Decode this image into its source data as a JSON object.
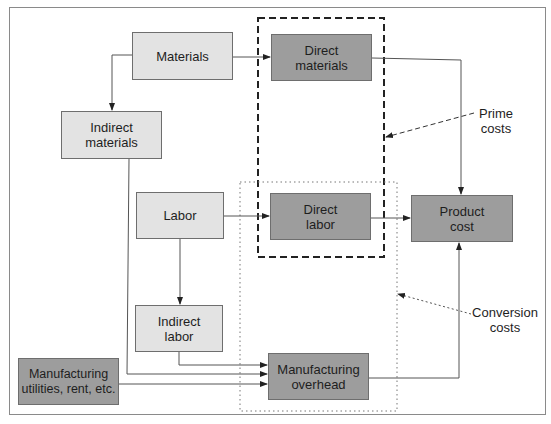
{
  "diagram": {
    "nodes": {
      "materials": {
        "label": "Materials",
        "fill": "#e3e3e3"
      },
      "indirect_materials": {
        "label": "Indirect materials",
        "fill": "#e3e3e3"
      },
      "labor": {
        "label": "Labor",
        "fill": "#e3e3e3"
      },
      "indirect_labor": {
        "label": "Indirect labor",
        "fill": "#e3e3e3"
      },
      "manufacturing_utilities": {
        "label": "Manufacturing utilities, rent, etc.",
        "fill": "#9d9d9d"
      },
      "direct_materials": {
        "label": "Direct materials",
        "fill": "#9d9d9d"
      },
      "direct_labor": {
        "label": "Direct labor",
        "fill": "#9d9d9d"
      },
      "manufacturing_overhead": {
        "label": "Manufacturing overhead",
        "fill": "#9d9d9d"
      },
      "product_cost": {
        "label": "Product cost",
        "fill": "#9d9d9d"
      }
    },
    "groups": {
      "prime_costs": {
        "label": "Prime costs",
        "style": "dashed",
        "members": [
          "Direct materials",
          "Direct labor"
        ]
      },
      "conversion_costs": {
        "label": "Conversion costs",
        "style": "dotted",
        "members": [
          "Direct labor",
          "Manufacturing overhead"
        ]
      }
    },
    "edges": [
      {
        "from": "Materials",
        "to": "Direct materials"
      },
      {
        "from": "Materials",
        "to": "Indirect materials"
      },
      {
        "from": "Indirect materials",
        "to": "Manufacturing overhead"
      },
      {
        "from": "Labor",
        "to": "Direct labor"
      },
      {
        "from": "Labor",
        "to": "Indirect labor"
      },
      {
        "from": "Indirect labor",
        "to": "Manufacturing overhead"
      },
      {
        "from": "Manufacturing utilities, rent, etc.",
        "to": "Manufacturing overhead"
      },
      {
        "from": "Direct materials",
        "to": "Product cost"
      },
      {
        "from": "Direct labor",
        "to": "Product cost"
      },
      {
        "from": "Manufacturing overhead",
        "to": "Product cost"
      }
    ],
    "colors": {
      "light_box": "#e3e3e3",
      "dark_box": "#9d9d9d",
      "line": "#5a5a5a",
      "frame": "#8a8a8a"
    }
  }
}
